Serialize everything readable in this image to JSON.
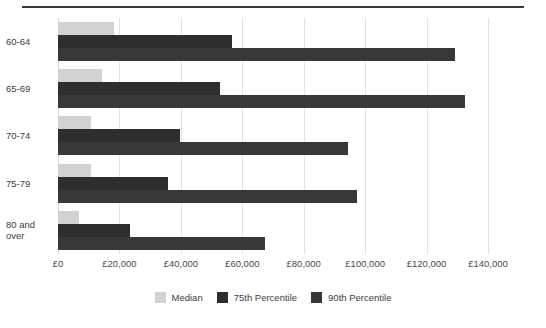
{
  "chart_data": {
    "type": "bar",
    "orientation": "horizontal",
    "title": "",
    "subtitle": "",
    "xlabel": "",
    "ylabel": "",
    "categories": [
      "60-64",
      "65-69",
      "70-74",
      "75-79",
      "80 and\nover"
    ],
    "series": [
      {
        "name": "Median",
        "color": "#d2d2d2",
        "values": [
          18100,
          14400,
          10800,
          10800,
          6700
        ]
      },
      {
        "name": "75th Percentile",
        "color": "#2e2e2e",
        "values": [
          56800,
          52800,
          39600,
          35900,
          23400
        ]
      },
      {
        "name": "90th Percentile",
        "color": "#383838",
        "values": [
          129100,
          132400,
          94500,
          97400,
          67300
        ]
      }
    ],
    "xlim": [
      0,
      140000
    ],
    "xtick_values": [
      0,
      20000,
      40000,
      60000,
      80000,
      100000,
      120000,
      140000
    ],
    "xtick_labels": [
      "£0",
      "£20,000",
      "£40,000",
      "£60,000",
      "£80,000",
      "£100,000",
      "£120,000",
      "£140,000"
    ],
    "grid": true,
    "grid_axis": "x",
    "legend_position": "bottom-center",
    "currency_symbol": "£"
  },
  "legend": {
    "items": [
      {
        "label": "Median",
        "swatch": "median"
      },
      {
        "label": "75th Percentile",
        "swatch": "p75"
      },
      {
        "label": "90th Percentile",
        "swatch": "p90"
      }
    ]
  },
  "colors": {
    "median": "#d2d2d2",
    "p75": "#2e2e2e",
    "p90": "#383838",
    "grid": "#e3e3e3",
    "rule": "#3a3a3a",
    "text": "#3d3d3d",
    "background": "#ffffff"
  }
}
